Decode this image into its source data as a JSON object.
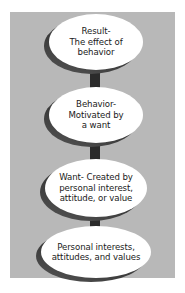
{
  "diagram": {
    "title": "",
    "direction": "bottom-to-top",
    "colors": {
      "background": "#d4d4d4",
      "node_fill": "#ffffff",
      "node_shadow": "#3a3a3a",
      "arrow": "#2b2b2b",
      "text": "#1a1a1a"
    },
    "nodes": [
      {
        "id": "result",
        "label": "Result-\nThe effect of\nbehavior"
      },
      {
        "id": "behavior",
        "label": "Behavior-\nMotivated by\na want"
      },
      {
        "id": "want",
        "label": "Want- Created by\npersonal interest,\nattitude, or value"
      },
      {
        "id": "personal",
        "label": "Personal interests,\nattitudes, and values"
      }
    ],
    "edges": [
      {
        "from": "personal",
        "to": "want",
        "icon": "up-arrow-icon"
      },
      {
        "from": "want",
        "to": "behavior",
        "icon": "up-arrow-icon"
      },
      {
        "from": "behavior",
        "to": "result",
        "icon": "up-arrow-icon"
      }
    ]
  }
}
